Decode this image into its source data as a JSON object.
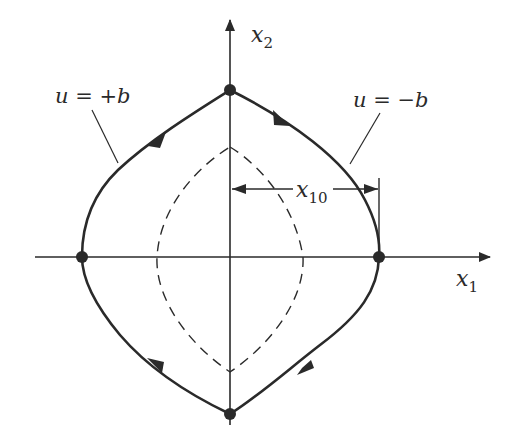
{
  "diagram": {
    "type": "phase-plane",
    "axes": {
      "x_label": "x",
      "x_subscript": "1",
      "y_label": "x",
      "y_subscript": "2"
    },
    "labels": {
      "plus_b": "u = +b",
      "minus_b": "u = −b",
      "x10_main": "x",
      "x10_sub": "10"
    },
    "colors": {
      "stroke": "#2a2a2a",
      "background": "#ffffff"
    },
    "trajectory": {
      "style": "solid",
      "switching_points": [
        "top",
        "right",
        "bottom",
        "left"
      ],
      "direction": "clockwise"
    },
    "inner_trajectory": {
      "style": "dashed"
    }
  }
}
